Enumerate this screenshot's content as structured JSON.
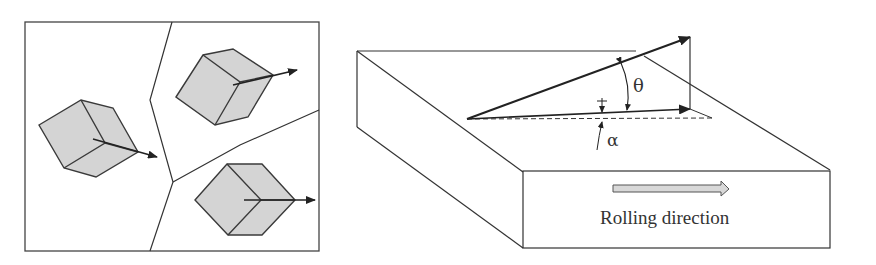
{
  "figure": {
    "left_panel": {
      "title": "Polycrystal grains with cube orientations",
      "grains": [
        {
          "name": "grain-left"
        },
        {
          "name": "grain-top-right"
        },
        {
          "name": "grain-bottom-right"
        }
      ]
    },
    "right_panel": {
      "angle_theta": "θ",
      "angle_alpha": "α",
      "rolling_direction_label": "Rolling direction"
    },
    "colors": {
      "line": "#3a3a3a",
      "cube_fill": "#d4d4d4",
      "arrow": "#222222",
      "rd_arrow_fill": "#d8d8d8"
    }
  }
}
